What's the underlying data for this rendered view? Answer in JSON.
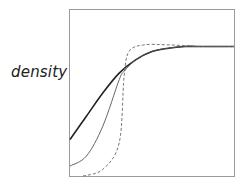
{
  "chart_data": {
    "type": "line",
    "title": "",
    "xlabel": "",
    "ylabel": "density",
    "grid": false,
    "legend": null,
    "axis_ticks": "none",
    "series": [
      {
        "name": "thick solid",
        "style": "solid-thick",
        "color": "#222222",
        "points": [
          [
            0,
            0.22
          ],
          [
            0.1,
            0.36
          ],
          [
            0.2,
            0.5
          ],
          [
            0.3,
            0.62
          ],
          [
            0.4,
            0.7
          ],
          [
            0.5,
            0.75
          ],
          [
            0.6,
            0.77
          ],
          [
            0.7,
            0.78
          ],
          [
            0.8,
            0.78
          ],
          [
            0.9,
            0.78
          ],
          [
            1.0,
            0.78
          ]
        ]
      },
      {
        "name": "thin solid",
        "style": "solid-thin",
        "color": "#555555",
        "points": [
          [
            0,
            0.06
          ],
          [
            0.1,
            0.12
          ],
          [
            0.2,
            0.3
          ],
          [
            0.3,
            0.58
          ],
          [
            0.33,
            0.63
          ],
          [
            0.4,
            0.7
          ],
          [
            0.5,
            0.75
          ],
          [
            0.6,
            0.77
          ],
          [
            0.7,
            0.78
          ],
          [
            0.8,
            0.78
          ],
          [
            1.0,
            0.78
          ]
        ]
      },
      {
        "name": "dashed",
        "style": "dashed",
        "color": "#666666",
        "points": [
          [
            0.08,
            0.0
          ],
          [
            0.2,
            0.04
          ],
          [
            0.3,
            0.2
          ],
          [
            0.33,
            0.6
          ],
          [
            0.36,
            0.75
          ],
          [
            0.45,
            0.79
          ],
          [
            0.6,
            0.79
          ],
          [
            0.8,
            0.78
          ],
          [
            1.0,
            0.78
          ]
        ]
      }
    ],
    "xlim": [
      0,
      1
    ],
    "ylim": [
      0,
      1
    ]
  }
}
